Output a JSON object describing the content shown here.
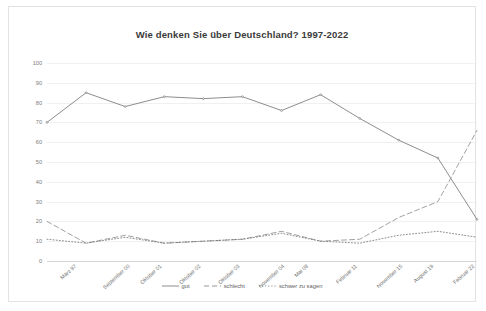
{
  "chart_data": {
    "type": "line",
    "title": "Wie denken Sie über Deutschland? 1997-2022",
    "xlabel": "",
    "ylabel": "",
    "ylim": [
      0,
      100
    ],
    "ytick_step": 10,
    "grid": true,
    "legend_position": "bottom",
    "categories": [
      "März 97",
      "September 00",
      "Oktober 01",
      "Oktober 02",
      "Oktober 03",
      "November 04",
      "Mai 08",
      "Februar 11",
      "November 15",
      "August 19",
      "Februar 22",
      "Mai 22"
    ],
    "yticks": [
      "0",
      "10",
      "20",
      "30",
      "40",
      "50",
      "60",
      "70",
      "80",
      "90",
      "100"
    ],
    "series": [
      {
        "name": "gut",
        "style": "solid",
        "color": "#808080",
        "values": [
          70,
          85,
          78,
          83,
          82,
          83,
          76,
          84,
          72,
          61,
          52,
          21
        ]
      },
      {
        "name": "schlecht",
        "style": "dashed",
        "color": "#8a8a8a",
        "values": [
          20,
          9,
          13,
          9,
          10,
          11,
          15,
          10,
          11,
          22,
          30,
          66
        ]
      },
      {
        "name": "schwer zu sagen",
        "style": "dotted",
        "color": "#6f6f6f",
        "values": [
          11,
          9,
          12,
          9,
          10,
          11,
          14,
          10,
          9,
          13,
          15,
          12
        ]
      }
    ]
  },
  "legend": {
    "items": [
      {
        "label": "gut"
      },
      {
        "label": "schlecht"
      },
      {
        "label": "schwer zu sagen"
      }
    ]
  }
}
